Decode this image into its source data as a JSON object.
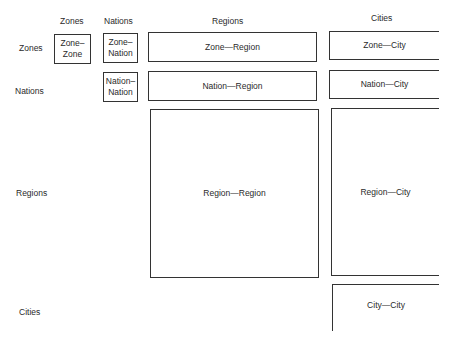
{
  "column_headers": [
    "Zones",
    "Nations",
    "Regions",
    "Cities"
  ],
  "row_headers": [
    "Zones",
    "Nations",
    "Regions",
    "Cities"
  ],
  "cells": {
    "zone_zone": "Zone–\nZone",
    "zone_nation": "Zone–\nNation",
    "nation_nation": "Nation–\nNation",
    "zone_region": "Zone—Region",
    "nation_region": "Nation—Region",
    "region_region": "Region—Region",
    "zone_city": "Zone—City",
    "nation_city": "Nation—City",
    "region_city": "Region—City",
    "city_city": "City—City"
  }
}
